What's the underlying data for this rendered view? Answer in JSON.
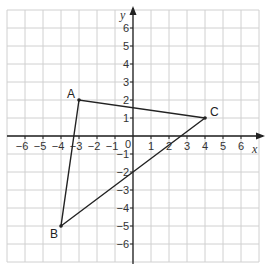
{
  "chart_data": {
    "type": "scatter",
    "title": "",
    "xlabel": "x",
    "ylabel": "y",
    "xlim": [
      -7,
      7
    ],
    "ylim": [
      -7,
      7
    ],
    "grid": true,
    "x_ticks": [
      -6,
      -5,
      -4,
      -3,
      -2,
      -1,
      1,
      2,
      3,
      4,
      5,
      6
    ],
    "y_ticks": [
      -6,
      -5,
      -4,
      -3,
      -2,
      -1,
      1,
      2,
      3,
      4,
      5,
      6
    ],
    "origin_label": "0",
    "points": [
      {
        "name": "A",
        "x": -3,
        "y": 2
      },
      {
        "name": "B",
        "x": -4,
        "y": -5
      },
      {
        "name": "C",
        "x": 4,
        "y": 1
      }
    ],
    "polygon": [
      "A",
      "B",
      "C"
    ]
  }
}
